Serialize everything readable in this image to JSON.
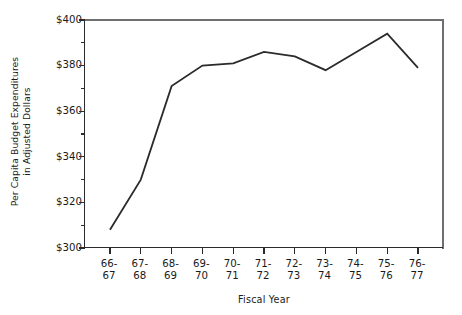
{
  "chart_data": {
    "type": "line",
    "title": "",
    "xlabel": "Fiscal Year",
    "ylabel": "Per Capita Budget Expenditures in Adjusted Dollars",
    "ylabel_line1": "Per Capita Budget Expenditures",
    "ylabel_line2": "in Adjusted Dollars",
    "categories": [
      "66-67",
      "67-68",
      "68-69",
      "69-70",
      "70-71",
      "71-72",
      "72-73",
      "73-74",
      "74-75",
      "75-76",
      "76-77"
    ],
    "category_lines": [
      {
        "top": "66-",
        "bottom": "67"
      },
      {
        "top": "67-",
        "bottom": "68"
      },
      {
        "top": "68-",
        "bottom": "69"
      },
      {
        "top": "69-",
        "bottom": "70"
      },
      {
        "top": "70-",
        "bottom": "71"
      },
      {
        "top": "71-",
        "bottom": "72"
      },
      {
        "top": "72-",
        "bottom": "73"
      },
      {
        "top": "73-",
        "bottom": "74"
      },
      {
        "top": "74-",
        "bottom": "75"
      },
      {
        "top": "75-",
        "bottom": "76"
      },
      {
        "top": "76-",
        "bottom": "77"
      }
    ],
    "values": [
      308,
      330,
      371,
      380,
      381,
      386,
      384,
      378,
      386,
      394,
      379
    ],
    "ylim": [
      300,
      400
    ],
    "ytick_values": [
      300,
      310,
      320,
      330,
      340,
      350,
      360,
      370,
      380,
      390,
      400
    ],
    "ytick_labels": [
      "$300",
      "",
      "$320",
      "",
      "$340",
      "",
      "$360",
      "",
      "$380",
      "",
      "$400"
    ],
    "ytick_labels_major": [
      "$400",
      "$380",
      "$360",
      "$340",
      "$320",
      "$300"
    ],
    "grid": false,
    "legend": false,
    "line_color": "#2b2b2b",
    "axis_color": "#2b2b2b",
    "background_color": "#ffffff"
  }
}
